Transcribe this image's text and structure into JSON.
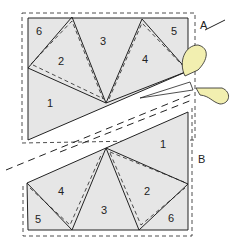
{
  "diagram": {
    "piece_a": {
      "label": "A",
      "sections": [
        "1",
        "2",
        "3",
        "4",
        "5",
        "6"
      ]
    },
    "piece_b": {
      "label": "B",
      "sections": [
        "1",
        "2",
        "3",
        "4",
        "5",
        "6"
      ]
    },
    "colors": {
      "fill": "#e6e6e6",
      "line": "#222222",
      "scissor_handle": "#f2efb0"
    }
  }
}
